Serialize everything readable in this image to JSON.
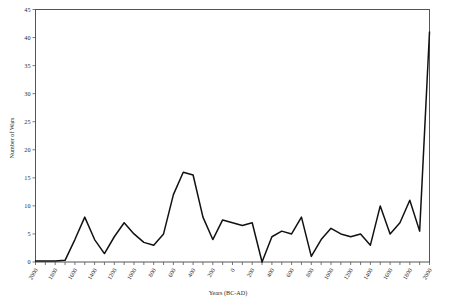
{
  "chart_data": {
    "type": "line",
    "title": "",
    "xlabel": "Years (BC-AD)",
    "ylabel": "Number of Wars",
    "xlim": [
      -2000,
      2000
    ],
    "ylim": [
      0,
      45
    ],
    "yticks": [
      0,
      5,
      10,
      15,
      20,
      25,
      30,
      35,
      40,
      45
    ],
    "xtick_labels": [
      "2000",
      "1800",
      "1600",
      "1400",
      "1200",
      "1000",
      "800",
      "600",
      "400",
      "200",
      "0",
      "200",
      "400",
      "600",
      "800",
      "1000",
      "1200",
      "1400",
      "1600",
      "1800",
      "2000"
    ],
    "xtick_values": [
      -2000,
      -1800,
      -1600,
      -1400,
      -1200,
      -1000,
      -800,
      -600,
      -400,
      -200,
      0,
      200,
      400,
      600,
      800,
      1000,
      1200,
      1400,
      1600,
      1800,
      2000
    ],
    "minor_tick_step": 100,
    "grid": false,
    "legend": false,
    "legend_position": "none",
    "series": [
      {
        "name": "Number of Wars",
        "x": [
          -2000,
          -1900,
          -1800,
          -1700,
          -1600,
          -1500,
          -1400,
          -1300,
          -1200,
          -1100,
          -1000,
          -900,
          -800,
          -700,
          -600,
          -500,
          -400,
          -300,
          -200,
          -100,
          0,
          100,
          200,
          300,
          400,
          500,
          600,
          700,
          800,
          900,
          1000,
          1100,
          1200,
          1300,
          1400,
          1500,
          1600,
          1700,
          1800,
          1900,
          2000
        ],
        "values": [
          0.2,
          0.2,
          0.2,
          0.3,
          4,
          8,
          4,
          1.5,
          4.5,
          7,
          5,
          3.5,
          3,
          5,
          12,
          16,
          15.5,
          8,
          4,
          7.5,
          7,
          6.5,
          7,
          0,
          4.5,
          5.5,
          5,
          8,
          1,
          4,
          6,
          5,
          4.5,
          5,
          3,
          10,
          5,
          7,
          11,
          5.5,
          41
        ]
      }
    ]
  },
  "axes": {
    "ylabel_text": "Number of Wars",
    "xlabel_text": "Years (BC-AD)"
  },
  "colors": {
    "line": "#111111",
    "frame": "#555555",
    "background": "#ffffff"
  }
}
